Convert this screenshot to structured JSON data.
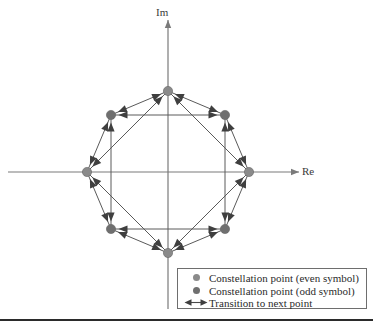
{
  "figure": {
    "axes": {
      "imaginary_label": "Im",
      "real_label": "Re",
      "origin": {
        "x": 168,
        "y": 172
      }
    },
    "colors": {
      "point_even": "#8a8a8a",
      "point_odd": "#6f6f6f",
      "transition": "#5a5a5a",
      "axis": "#7a7a7a",
      "legend_border": "#6e6e6e",
      "text": "#2b2b2b",
      "rule": "#2b2b2b"
    },
    "legend": {
      "items": [
        {
          "marker": "circle-even-icon",
          "label": "Constellation point (even symbol)"
        },
        {
          "marker": "circle-odd-icon",
          "label": "Constellation point (odd symbol)"
        },
        {
          "marker": "double-arrow-icon",
          "label": "Transition to next point"
        }
      ]
    }
  },
  "chart_data": {
    "type": "scatter",
    "xlabel": "Re",
    "ylabel": "Im",
    "xlim": [
      -1.55,
      1.75
    ],
    "ylim": [
      -1.6,
      1.75
    ],
    "grid": false,
    "legend_position": "bottom-right",
    "radius_px": 81,
    "center_px": {
      "x": 168,
      "y": 172
    },
    "points": [
      {
        "index": 0,
        "label": "even",
        "angle_deg": 0,
        "re": 1.0,
        "im": 0.0,
        "px": {
          "x": 249,
          "y": 172
        }
      },
      {
        "index": 1,
        "label": "odd",
        "angle_deg": 45,
        "re": 0.707,
        "im": 0.707,
        "px": {
          "x": 225,
          "y": 115
        }
      },
      {
        "index": 2,
        "label": "even",
        "angle_deg": 90,
        "re": 0.0,
        "im": 1.0,
        "px": {
          "x": 168,
          "y": 91
        }
      },
      {
        "index": 3,
        "label": "odd",
        "angle_deg": 135,
        "re": -0.707,
        "im": 0.707,
        "px": {
          "x": 111,
          "y": 115
        }
      },
      {
        "index": 4,
        "label": "even",
        "angle_deg": 180,
        "re": -1.0,
        "im": 0.0,
        "px": {
          "x": 87,
          "y": 172
        }
      },
      {
        "index": 5,
        "label": "odd",
        "angle_deg": 225,
        "re": -0.707,
        "im": -0.707,
        "px": {
          "x": 111,
          "y": 229
        }
      },
      {
        "index": 6,
        "label": "even",
        "angle_deg": 270,
        "re": 0.0,
        "im": -1.0,
        "px": {
          "x": 168,
          "y": 253
        }
      },
      {
        "index": 7,
        "label": "odd",
        "angle_deg": 315,
        "re": 0.707,
        "im": -0.707,
        "px": {
          "x": 225,
          "y": 229
        }
      }
    ],
    "transitions": [
      {
        "from": 0,
        "to": 1,
        "type": "adjacent"
      },
      {
        "from": 1,
        "to": 2,
        "type": "adjacent"
      },
      {
        "from": 2,
        "to": 3,
        "type": "adjacent"
      },
      {
        "from": 3,
        "to": 4,
        "type": "adjacent"
      },
      {
        "from": 4,
        "to": 5,
        "type": "adjacent"
      },
      {
        "from": 5,
        "to": 6,
        "type": "adjacent"
      },
      {
        "from": 6,
        "to": 7,
        "type": "adjacent"
      },
      {
        "from": 7,
        "to": 0,
        "type": "adjacent"
      },
      {
        "from": 0,
        "to": 2,
        "type": "skip-two"
      },
      {
        "from": 1,
        "to": 3,
        "type": "skip-two"
      },
      {
        "from": 2,
        "to": 4,
        "type": "skip-two"
      },
      {
        "from": 3,
        "to": 5,
        "type": "skip-two"
      },
      {
        "from": 4,
        "to": 6,
        "type": "skip-two"
      },
      {
        "from": 5,
        "to": 7,
        "type": "skip-two"
      },
      {
        "from": 6,
        "to": 0,
        "type": "skip-two"
      },
      {
        "from": 7,
        "to": 1,
        "type": "skip-two"
      }
    ],
    "axis_lines": [
      {
        "name": "real-axis",
        "from_px": {
          "x": 8,
          "y": 172
        },
        "to_px": {
          "x": 299,
          "y": 172
        },
        "arrow": "end"
      },
      {
        "name": "imaginary-axis",
        "from_px": {
          "x": 168,
          "y": 309
        },
        "to_px": {
          "x": 168,
          "y": 20
        },
        "arrow": "end"
      }
    ]
  }
}
